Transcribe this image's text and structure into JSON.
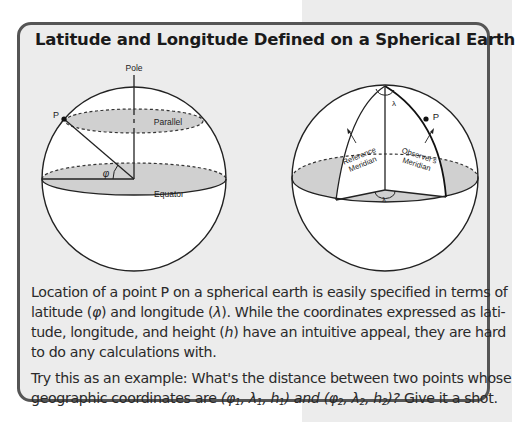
{
  "box": {
    "title": "Latitude and Longitude Defined on a Spherical Earth"
  },
  "figure_left": {
    "labels": {
      "pole": "Pole",
      "point": "P",
      "parallel": "Parallel",
      "latitude_symbol": "φ",
      "equator": "Equator"
    }
  },
  "figure_right": {
    "labels": {
      "lambda_top": "λ",
      "point": "P",
      "reference_meridian_line1": "Reference",
      "reference_meridian_line2": "Meridian",
      "observers_meridian_line1": "Observer's",
      "observers_meridian_line2": "Meridian",
      "lambda_bottom": "λ"
    }
  },
  "paragraph1": {
    "lines": [
      "Location of a point P on a spherical earth is easily specified in terms of",
      "latitude (",
      "φ",
      ") and longitude (",
      "λ",
      "). While the coordinates expressed as lati-",
      "tude, longitude, and height (",
      "h",
      ") have an intuitive appeal, they are hard",
      "to do any calculations with."
    ]
  },
  "paragraph2": {
    "line1": "Try this as an example: What's the distance between two points whose",
    "line2_prefix": "geographic coordinates are ",
    "coord1": "(φ",
    "coord1_sub1": "1",
    "coord1_mid": ", λ",
    "coord1_sub2": "1",
    "coord1_mid2": ", h",
    "coord1_sub3": "1",
    "coord1_end": ") and (φ",
    "coord2_sub1": "2",
    "coord2_mid": ", λ",
    "coord2_sub2": "2",
    "coord2_mid2": ", h",
    "coord2_sub3": "2",
    "coord2_end": ")?",
    "line2_suffix": " Give it a shot."
  }
}
